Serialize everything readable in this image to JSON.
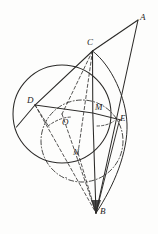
{
  "figure": {
    "kind": "hand-drawn-geometry-diagram",
    "background_color": "#fdfdfc",
    "ink_color": "#2b2a28",
    "label_color": "#262524",
    "canvas": {
      "width": 158,
      "height": 234
    },
    "points": [
      {
        "id": "A",
        "label": "A",
        "x": 138.0,
        "y": 20.0,
        "label_x": 140,
        "label_y": 13
      },
      {
        "id": "C",
        "label": "C",
        "x": 92.5,
        "y": 51.0,
        "label_x": 87,
        "label_y": 38
      },
      {
        "id": "D",
        "label": "D",
        "x": 35.0,
        "y": 105.0,
        "label_x": 27,
        "label_y": 96
      },
      {
        "id": "M",
        "label": "M",
        "x": 92.5,
        "y": 113.0,
        "label_x": 95,
        "label_y": 103
      },
      {
        "id": "E",
        "label": "E",
        "x": 119.0,
        "y": 120.0,
        "label_x": 120,
        "label_y": 114
      },
      {
        "id": "O",
        "label": "O",
        "x": 62.0,
        "y": 114.0,
        "label_x": 62,
        "label_y": 118
      },
      {
        "id": "N",
        "label": "N",
        "x": 78.0,
        "y": 153.0,
        "label_x": 73,
        "label_y": 148
      },
      {
        "id": "B",
        "label": "B",
        "x": 96.0,
        "y": 213.0,
        "label_x": 100,
        "label_y": 207
      }
    ],
    "circles": [
      {
        "id": "main-circle",
        "cx": 62,
        "cy": 114,
        "r": 49,
        "style": "solid"
      },
      {
        "id": "inner-circle",
        "cx": 82,
        "cy": 141,
        "r": 41,
        "style": "dash-dot"
      },
      {
        "id": "right-arc",
        "cx": 96,
        "cy": 126,
        "r": 80,
        "style": "solid-arc"
      }
    ],
    "segments": [
      {
        "id": "A-to-D-through-C",
        "from": "A",
        "to": "chord-left-end",
        "style": "solid"
      },
      {
        "id": "A-to-B",
        "from": "A",
        "to": "B",
        "style": "solid"
      },
      {
        "id": "C-to-B",
        "from": "C",
        "to": "B",
        "style": "solid"
      },
      {
        "id": "D-to-E",
        "from": "D",
        "to": "E",
        "style": "solid"
      },
      {
        "id": "C-to-D",
        "from": "C",
        "to": "D",
        "style": "dashed"
      },
      {
        "id": "C-to-O",
        "from": "C",
        "to": "O",
        "style": "dashed"
      },
      {
        "id": "C-to-N",
        "from": "C",
        "to": "N",
        "style": "dashed"
      },
      {
        "id": "D-to-B",
        "from": "D",
        "to": "B",
        "style": "dashed"
      },
      {
        "id": "N-to-B",
        "from": "N",
        "to": "B",
        "style": "dashed"
      },
      {
        "id": "M-to-B",
        "from": "M",
        "to": "B",
        "style": "dashed"
      },
      {
        "id": "E-to-B",
        "from": "E",
        "to": "B",
        "style": "solid"
      }
    ]
  }
}
